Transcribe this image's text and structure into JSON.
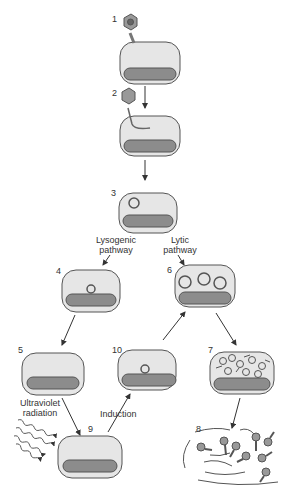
{
  "diagram": {
    "colors": {
      "cell_fill": "#e6e6e6",
      "chromosome": "#8c8c8c",
      "outline": "#555555",
      "phage": "#999999"
    },
    "steps": [
      {
        "number": "1"
      },
      {
        "number": "2"
      },
      {
        "number": "3"
      },
      {
        "number": "4"
      },
      {
        "number": "5"
      },
      {
        "number": "6"
      },
      {
        "number": "7"
      },
      {
        "number": "8"
      },
      {
        "number": "9"
      },
      {
        "number": "10"
      }
    ],
    "labels": {
      "lysogenic_line1": "Lysogenic",
      "lysogenic_line2": "pathway",
      "lytic_line1": "Lytic",
      "lytic_line2": "pathway",
      "uv_line1": "Ultraviolet",
      "uv_line2": "radiation",
      "induction": "Induction"
    }
  }
}
